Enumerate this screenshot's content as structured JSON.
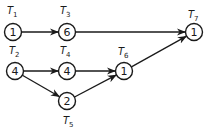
{
  "diagram": {
    "type": "task-precedence-graph",
    "nodes": [
      {
        "id": "T1",
        "label_main": "T",
        "label_sub": "1",
        "weight": "1",
        "cx": 13,
        "cy": 32,
        "lx": 7,
        "ly": 14
      },
      {
        "id": "T2",
        "label_main": "T",
        "label_sub": "2",
        "weight": "4",
        "cx": 15,
        "cy": 71,
        "lx": 9,
        "ly": 54
      },
      {
        "id": "T3",
        "label_main": "T",
        "label_sub": "3",
        "weight": "6",
        "cx": 67,
        "cy": 32,
        "lx": 60,
        "ly": 14
      },
      {
        "id": "T4",
        "label_main": "T",
        "label_sub": "4",
        "weight": "4",
        "cx": 67,
        "cy": 71,
        "lx": 60,
        "ly": 54
      },
      {
        "id": "T5",
        "label_main": "T",
        "label_sub": "5",
        "weight": "2",
        "cx": 67,
        "cy": 101,
        "lx": 63,
        "ly": 124
      },
      {
        "id": "T6",
        "label_main": "T",
        "label_sub": "6",
        "weight": "1",
        "cx": 124,
        "cy": 71,
        "lx": 118,
        "ly": 55
      },
      {
        "id": "T7",
        "label_main": "T",
        "label_sub": "7",
        "weight": "1",
        "cx": 194,
        "cy": 32,
        "lx": 188,
        "ly": 18
      }
    ],
    "edges": [
      {
        "from": "T1",
        "to": "T3"
      },
      {
        "from": "T3",
        "to": "T7"
      },
      {
        "from": "T2",
        "to": "T4"
      },
      {
        "from": "T2",
        "to": "T5"
      },
      {
        "from": "T4",
        "to": "T6"
      },
      {
        "from": "T5",
        "to": "T6"
      },
      {
        "from": "T6",
        "to": "T7"
      }
    ]
  }
}
